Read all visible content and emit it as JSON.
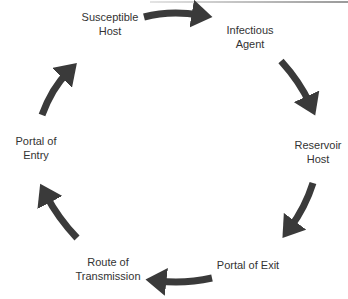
{
  "diagram": {
    "nodes": [
      {
        "id": "susceptible-host",
        "label": "Susceptible\nHost"
      },
      {
        "id": "infectious-agent",
        "label": "Infectious\nAgent"
      },
      {
        "id": "reservoir-host",
        "label": "Reservoir\nHost"
      },
      {
        "id": "portal-of-exit",
        "label": "Portal of Exit"
      },
      {
        "id": "route-of-transmission",
        "label": "Route of\nTransmission"
      },
      {
        "id": "portal-of-entry",
        "label": "Portal of\nEntry"
      }
    ],
    "edges": [
      {
        "from": "susceptible-host",
        "to": "infectious-agent"
      },
      {
        "from": "infectious-agent",
        "to": "reservoir-host"
      },
      {
        "from": "reservoir-host",
        "to": "portal-of-exit"
      },
      {
        "from": "portal-of-exit",
        "to": "route-of-transmission"
      },
      {
        "from": "route-of-transmission",
        "to": "portal-of-entry"
      },
      {
        "from": "portal-of-entry",
        "to": "susceptible-host"
      }
    ],
    "colors": {
      "arrow": "#3a3a3a",
      "text": "#333333",
      "background": "#ffffff"
    }
  }
}
